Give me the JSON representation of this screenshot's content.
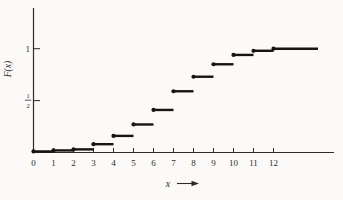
{
  "figure": {
    "background": "#fbfaf8",
    "ink_color": "#2e2c29",
    "curve_color": "#161513"
  },
  "chart_data": {
    "type": "step",
    "title": "",
    "xlabel": "x",
    "ylabel": "F(x)",
    "xlim": [
      0,
      15
    ],
    "ylim": [
      0,
      1.4
    ],
    "grid": false,
    "legend": "none",
    "x_tick_labels": [
      "0",
      "1",
      "2",
      "3",
      "4",
      "5",
      "6",
      "7",
      "8",
      "9",
      "10",
      "11",
      "12"
    ],
    "y_ticks": [
      {
        "value": 1,
        "label": "1"
      },
      {
        "value": 0.5,
        "label": "1/2",
        "numerator": "1",
        "denominator": "2"
      }
    ],
    "steps": [
      {
        "x": 0,
        "F": 0.01
      },
      {
        "x": 1,
        "F": 0.02
      },
      {
        "x": 2,
        "F": 0.03
      },
      {
        "x": 3,
        "F": 0.08
      },
      {
        "x": 4,
        "F": 0.16
      },
      {
        "x": 5,
        "F": 0.27
      },
      {
        "x": 6,
        "F": 0.41
      },
      {
        "x": 7,
        "F": 0.59
      },
      {
        "x": 8,
        "F": 0.73
      },
      {
        "x": 9,
        "F": 0.85
      },
      {
        "x": 10,
        "F": 0.94
      },
      {
        "x": 11,
        "F": 0.98
      },
      {
        "x": 12,
        "F": 1.0
      }
    ],
    "marker": "closed dot at left end of each step"
  }
}
